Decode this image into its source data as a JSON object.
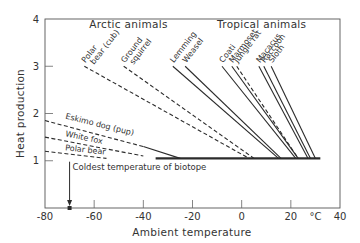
{
  "chart_data": {
    "type": "line",
    "title": "",
    "xlabel": "Ambient temperature",
    "ylabel": "Heat production",
    "x_unit": "°C",
    "xlim": [
      -80,
      40
    ],
    "ylim": [
      0,
      4
    ],
    "x_ticks": [
      -80,
      -60,
      -40,
      -20,
      0,
      20,
      40
    ],
    "x_tick_labels": [
      "-80",
      "-60",
      "-40",
      "-20",
      "0",
      "20",
      "40"
    ],
    "y_ticks": [
      1,
      2,
      3,
      4
    ],
    "y_tick_labels": [
      "1",
      "2",
      "3",
      "4"
    ],
    "grid": false,
    "group_labels": [
      {
        "text": "Arctic animals",
        "x": -62,
        "y": 3.8
      },
      {
        "text": "Tropical animals",
        "x": -10,
        "y": 3.8
      }
    ],
    "baseline": {
      "x": [
        -35,
        32
      ],
      "y": [
        1.05,
        1.05
      ],
      "style": "solid-thick"
    },
    "series": [
      {
        "name": "Polar bear (cub)",
        "group": "arctic",
        "style": "dashed",
        "x": [
          -64,
          3
        ],
        "y": [
          3.0,
          1.05
        ]
      },
      {
        "name": "Ground squirrel",
        "group": "arctic",
        "style": "dashed",
        "x": [
          -48,
          5
        ],
        "y": [
          3.0,
          1.05
        ]
      },
      {
        "name": "Eskimo dog (pup)",
        "group": "arctic",
        "style": "dashed-then-solid",
        "x": [
          -80,
          -40,
          -25
        ],
        "y": [
          1.85,
          1.3,
          1.05
        ]
      },
      {
        "name": "White fox",
        "group": "arctic",
        "style": "dashed",
        "x": [
          -80,
          -40
        ],
        "y": [
          1.5,
          1.1
        ]
      },
      {
        "name": "Polar bear",
        "group": "arctic",
        "style": "dashed",
        "x": [
          -80,
          -55
        ],
        "y": [
          1.2,
          1.05
        ]
      },
      {
        "name": "Lemming",
        "group": "tropical",
        "style": "solid",
        "x": [
          -28,
          15
        ],
        "y": [
          3.0,
          1.05
        ]
      },
      {
        "name": "Weasel",
        "group": "tropical",
        "style": "solid",
        "x": [
          -23,
          16
        ],
        "y": [
          3.0,
          1.05
        ]
      },
      {
        "name": "Coati",
        "group": "tropical",
        "style": "solid",
        "x": [
          -8,
          22
        ],
        "y": [
          3.0,
          1.05
        ]
      },
      {
        "name": "Marmoset",
        "group": "tropical",
        "style": "solid",
        "x": [
          -4,
          23
        ],
        "y": [
          3.0,
          1.05
        ]
      },
      {
        "name": "Jungle rat",
        "group": "tropical",
        "style": "dashed",
        "x": [
          -2,
          23
        ],
        "y": [
          3.0,
          1.05
        ]
      },
      {
        "name": "Macacus",
        "group": "tropical",
        "style": "solid",
        "x": [
          7,
          27
        ],
        "y": [
          3.0,
          1.05
        ]
      },
      {
        "name": "Raccoon",
        "group": "tropical",
        "style": "solid",
        "x": [
          9,
          28
        ],
        "y": [
          3.0,
          1.05
        ]
      },
      {
        "name": "Sloth",
        "group": "tropical",
        "style": "solid",
        "x": [
          12,
          30
        ],
        "y": [
          3.0,
          1.05
        ]
      }
    ],
    "annotations": [
      {
        "text": "Coldest temperature of biotope",
        "x": -70,
        "y": 0.3,
        "arrow": "down-to-axis"
      }
    ]
  }
}
